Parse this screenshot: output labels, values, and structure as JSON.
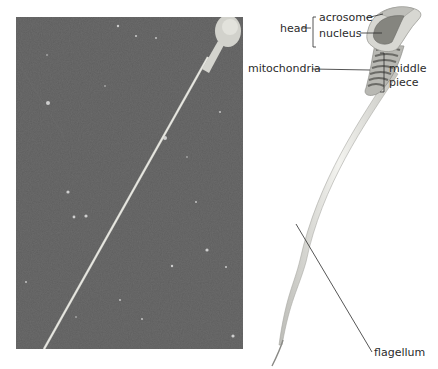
{
  "figure": {
    "micrograph": {
      "description": "scanning electron micrograph of a sperm cell",
      "background_color": "#5f5f5f",
      "cell_color": "#d8d8d2"
    },
    "diagram": {
      "labels": {
        "head": "head",
        "acrosome": "acrosome",
        "nucleus": "nucleus",
        "mitochondria": "mitochondria",
        "middle_piece_line1": "middle",
        "middle_piece_line2": "piece",
        "flagellum": "flagellum"
      },
      "colors": {
        "outline": "#9a9a9a",
        "head_fill": "#c9c9c4",
        "nucleus_fill": "#7d7d78",
        "mitochondria_fill": "#6e6e6a",
        "tail_fill": "#e6e6e2",
        "line": "#2b2b2b"
      }
    }
  }
}
